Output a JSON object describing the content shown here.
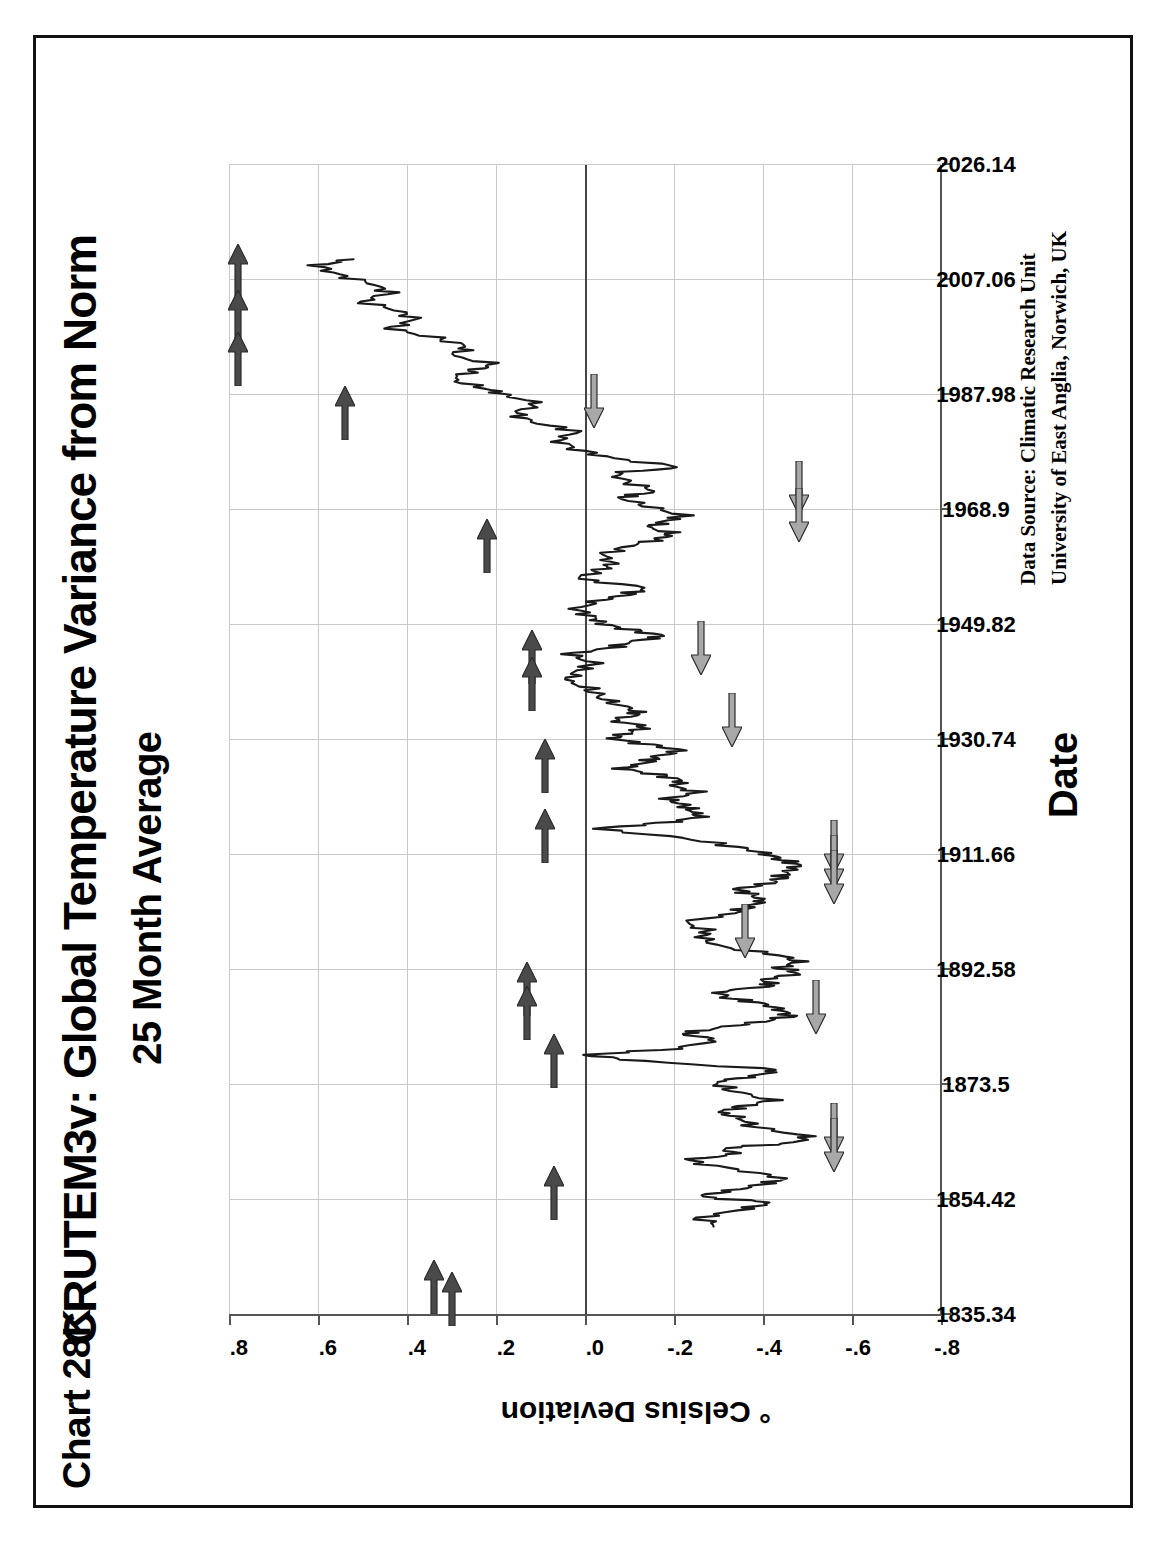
{
  "page": {
    "chart_tag": "Chart 28K",
    "title": "CRUTEM3v:  Global Temperature Variance from Norm",
    "subtitle": "25 Month Average",
    "source_line1": "Data Source:  Climatic Research Unit",
    "source_line2": "University of East Anglia, Norwich, UK",
    "border_color": "#111111"
  },
  "chart_data": {
    "type": "line",
    "title": "CRUTEM3v:  Global Temperature Variance from Norm",
    "subtitle": "25 Month Average",
    "xlabel": "Date",
    "ylabel": "° Celsius Deviation",
    "xlim": [
      1835.34,
      2026.14
    ],
    "ylim": [
      -0.8,
      0.8
    ],
    "grid": true,
    "legend": "none",
    "orientation": "rotated-90-ccw",
    "line_color": "#1a1a1a",
    "xticks": [
      "1835.34",
      "1854.42",
      "1873.5",
      "1892.58",
      "1911.66",
      "1930.74",
      "1949.82",
      "1968.9",
      "1987.98",
      "2007.06",
      "2026.14"
    ],
    "xtick_values": [
      1835.34,
      1854.42,
      1873.5,
      1892.58,
      1911.66,
      1930.74,
      1949.82,
      1968.9,
      1987.98,
      2007.06,
      2026.14
    ],
    "yticks": [
      ".8",
      ".6",
      ".4",
      ".2",
      ".0",
      "-.2",
      "-.4",
      "-.6",
      "-.8"
    ],
    "ytick_values": [
      0.8,
      0.6,
      0.4,
      0.2,
      0.0,
      -0.2,
      -0.4,
      -0.6,
      -0.8
    ],
    "x": [
      1850.0,
      1851.5,
      1853.0,
      1854.0,
      1855.0,
      1856.0,
      1857.0,
      1858.0,
      1859.5,
      1861.0,
      1862.0,
      1863.0,
      1864.0,
      1865.0,
      1866.5,
      1868.0,
      1869.0,
      1870.0,
      1871.0,
      1872.5,
      1874.0,
      1875.0,
      1876.0,
      1877.5,
      1878.5,
      1879.5,
      1881.0,
      1882.0,
      1883.0,
      1884.0,
      1885.0,
      1886.0,
      1887.0,
      1888.0,
      1889.0,
      1890.0,
      1891.0,
      1892.0,
      1893.0,
      1894.0,
      1895.0,
      1896.5,
      1898.0,
      1899.0,
      1900.5,
      1902.0,
      1903.0,
      1904.0,
      1905.0,
      1906.0,
      1907.0,
      1908.0,
      1909.0,
      1910.0,
      1911.0,
      1912.0,
      1913.0,
      1914.5,
      1916.0,
      1917.0,
      1918.0,
      1919.0,
      1920.0,
      1921.0,
      1922.0,
      1923.0,
      1924.0,
      1925.0,
      1926.0,
      1927.0,
      1928.0,
      1929.0,
      1930.0,
      1931.0,
      1932.0,
      1933.0,
      1934.0,
      1935.0,
      1936.0,
      1937.5,
      1939.0,
      1940.5,
      1942.0,
      1943.5,
      1945.0,
      1946.0,
      1947.0,
      1948.0,
      1949.0,
      1950.0,
      1951.0,
      1952.5,
      1954.0,
      1955.0,
      1956.0,
      1957.5,
      1959.0,
      1960.0,
      1961.5,
      1963.0,
      1964.0,
      1965.0,
      1966.0,
      1967.0,
      1968.0,
      1969.5,
      1971.0,
      1972.0,
      1973.5,
      1975.0,
      1976.0,
      1977.5,
      1979.0,
      1980.5,
      1982.0,
      1983.5,
      1985.0,
      1986.5,
      1988.0,
      1989.0,
      1990.5,
      1992.0,
      1993.0,
      1994.5,
      1996.0,
      1997.5,
      1999.0,
      2000.5,
      2002.0,
      2003.5,
      2005.0,
      2006.5,
      2008.0,
      2009.5,
      2010.5
    ],
    "y": [
      -0.3,
      -0.26,
      -0.36,
      -0.42,
      -0.25,
      -0.33,
      -0.4,
      -0.45,
      -0.34,
      -0.22,
      -0.34,
      -0.31,
      -0.48,
      -0.5,
      -0.38,
      -0.35,
      -0.3,
      -0.36,
      -0.42,
      -0.33,
      -0.29,
      -0.38,
      -0.44,
      -0.12,
      0.0,
      -0.2,
      -0.3,
      -0.22,
      -0.3,
      -0.4,
      -0.46,
      -0.44,
      -0.4,
      -0.32,
      -0.3,
      -0.42,
      -0.4,
      -0.48,
      -0.44,
      -0.48,
      -0.44,
      -0.3,
      -0.26,
      -0.28,
      -0.22,
      -0.34,
      -0.36,
      -0.4,
      -0.38,
      -0.34,
      -0.42,
      -0.44,
      -0.46,
      -0.48,
      -0.44,
      -0.4,
      -0.34,
      -0.22,
      -0.02,
      -0.18,
      -0.26,
      -0.24,
      -0.22,
      -0.18,
      -0.26,
      -0.2,
      -0.22,
      -0.16,
      -0.08,
      -0.14,
      -0.16,
      -0.22,
      -0.14,
      -0.06,
      -0.1,
      -0.14,
      -0.06,
      -0.12,
      -0.1,
      -0.04,
      -0.02,
      0.04,
      0.02,
      -0.02,
      0.04,
      -0.06,
      -0.1,
      -0.18,
      -0.1,
      -0.04,
      -0.02,
      0.02,
      -0.04,
      -0.1,
      -0.14,
      0.02,
      -0.04,
      -0.06,
      -0.04,
      -0.1,
      -0.16,
      -0.2,
      -0.14,
      -0.18,
      -0.22,
      -0.14,
      -0.08,
      -0.16,
      -0.1,
      -0.06,
      -0.22,
      -0.06,
      0.02,
      0.06,
      0.02,
      0.12,
      0.16,
      0.1,
      0.18,
      0.22,
      0.3,
      0.26,
      0.2,
      0.3,
      0.26,
      0.34,
      0.44,
      0.38,
      0.42,
      0.5,
      0.44,
      0.48,
      0.56,
      0.6,
      0.52,
      0.58
    ],
    "annotations": {
      "warm_peaks": {
        "symbol": "right-arrow",
        "color": "#4a4a4a",
        "meaning": "warm peak marker",
        "count": 15
      },
      "cold_troughs": {
        "symbol": "left-arrow",
        "color": "#a8a8a8",
        "meaning": "cold trough marker",
        "count": 13
      }
    }
  },
  "arrows_dark": [
    {
      "x": 2008.5,
      "y": 0.78
    },
    {
      "x": 2001.0,
      "y": 0.78
    },
    {
      "x": 1994.0,
      "y": 0.78
    },
    {
      "x": 1985.0,
      "y": 0.54
    },
    {
      "x": 1963.0,
      "y": 0.22
    },
    {
      "x": 1944.5,
      "y": 0.12
    },
    {
      "x": 1940.0,
      "y": 0.12
    },
    {
      "x": 1926.5,
      "y": 0.09
    },
    {
      "x": 1914.8,
      "y": 0.09
    },
    {
      "x": 1889.5,
      "y": 0.13
    },
    {
      "x": 1885.5,
      "y": 0.13
    },
    {
      "x": 1877.5,
      "y": 0.07
    },
    {
      "x": 1855.5,
      "y": 0.07
    },
    {
      "x": 1840.0,
      "y": 0.34
    },
    {
      "x": 1838.0,
      "y": 0.3
    }
  ],
  "arrows_light": [
    {
      "x": 1987.0,
      "y": -0.02
    },
    {
      "x": 1972.5,
      "y": -0.48
    },
    {
      "x": 1968.0,
      "y": -0.48
    },
    {
      "x": 1946.0,
      "y": -0.26
    },
    {
      "x": 1934.0,
      "y": -0.33
    },
    {
      "x": 1913.0,
      "y": -0.56
    },
    {
      "x": 1910.5,
      "y": -0.56
    },
    {
      "x": 1908.0,
      "y": -0.56
    },
    {
      "x": 1899.0,
      "y": -0.36
    },
    {
      "x": 1886.5,
      "y": -0.52
    },
    {
      "x": 1866.0,
      "y": -0.56
    },
    {
      "x": 1863.5,
      "y": -0.56
    }
  ]
}
